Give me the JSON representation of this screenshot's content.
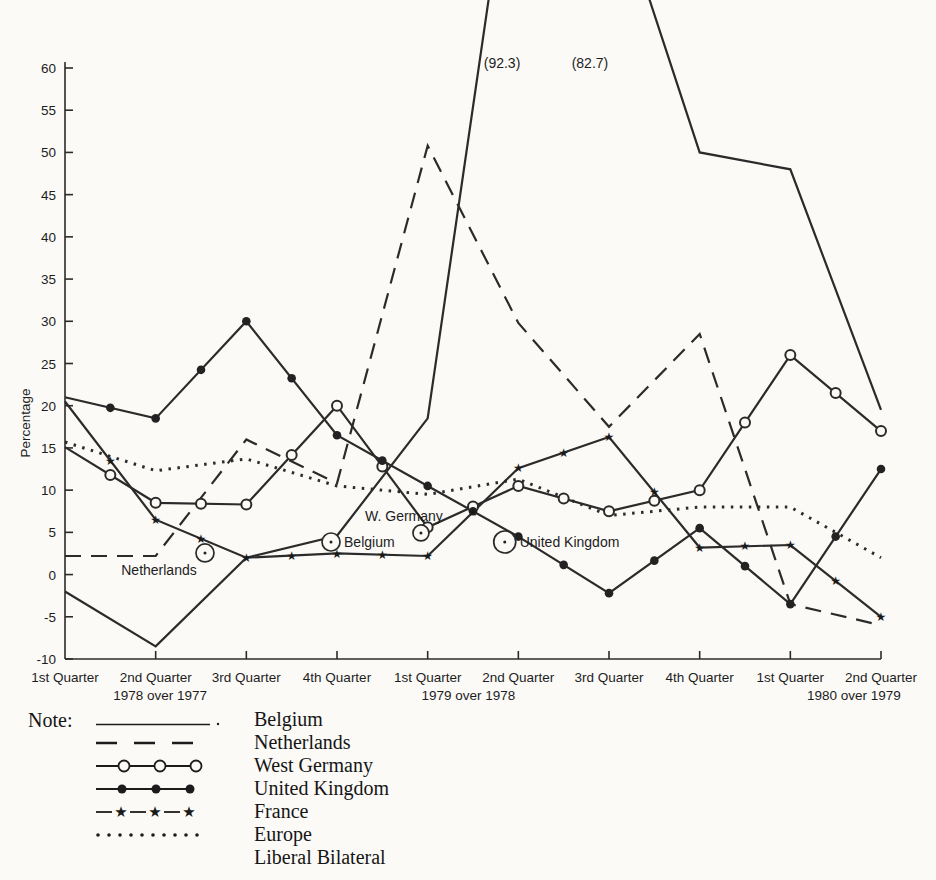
{
  "figure": {
    "background": "#fbfaf7",
    "ink": "#2b2b2b"
  },
  "chart_data": {
    "type": "line",
    "title": "",
    "ylabel": "Percentage",
    "grid": false,
    "x_categories": [
      "1st Quarter",
      "2nd Quarter",
      "3rd Quarter",
      "4th Quarter",
      "1st Quarter",
      "2nd Quarter",
      "3rd Quarter",
      "4th Quarter",
      "1st Quarter",
      "2nd Quarter"
    ],
    "year_labels": [
      {
        "text": "1978 over 1977",
        "q": 1.05
      },
      {
        "text": "1979 over 1978",
        "q": 4.45
      },
      {
        "text": "1980 over 1979",
        "q": 8.7
      }
    ],
    "y_ticks": [
      {
        "v": 60,
        "label": "60"
      },
      {
        "v": 55,
        "label": "55"
      },
      {
        "v": 50,
        "label": "50"
      },
      {
        "v": 45,
        "label": "45"
      },
      {
        "v": 40,
        "label": "40"
      },
      {
        "v": 35,
        "label": "35"
      },
      {
        "v": 30,
        "label": "30"
      },
      {
        "v": 25,
        "label": "25"
      },
      {
        "v": 20,
        "label": "20"
      },
      {
        "v": 15,
        "label": "15"
      },
      {
        "v": 10,
        "label": "10"
      },
      {
        "v": 5,
        "label": "5"
      },
      {
        "v": 0,
        "label": "0"
      },
      {
        "v": -5,
        "label": "-5"
      },
      {
        "v": -10,
        "label": "-10"
      }
    ],
    "ylim": [
      -10,
      60
    ],
    "plot": {
      "x_left": 65,
      "x_right": 881,
      "y_top": 68,
      "y_bottom": 659,
      "vmax": 60,
      "vmin": -10
    },
    "series": [
      {
        "name": "Belgium",
        "line": "solid",
        "marker": "none",
        "values": [
          -2,
          -8.5,
          2,
          4.6,
          18.5,
          92.3,
          82.7,
          50,
          48,
          19.5
        ]
      },
      {
        "name": "Netherlands",
        "line": "dashed",
        "marker": "none",
        "values": [
          2.2,
          2.2,
          16,
          10.8,
          50.8,
          29.8,
          17.5,
          28.5,
          -3.5,
          -6
        ]
      },
      {
        "name": "West Germany",
        "line": "solid",
        "marker": "circle",
        "values": [
          15.1,
          8.5,
          8.3,
          20,
          5.6,
          10.5,
          7.5,
          10,
          26,
          17
        ]
      },
      {
        "name": "United Kingdom",
        "line": "solid",
        "marker": "dot",
        "values": [
          21,
          18.5,
          30,
          16.5,
          10.5,
          4.5,
          -2.2,
          5.5,
          -3.5,
          12.5
        ]
      },
      {
        "name": "France",
        "line": "solid",
        "marker": "star",
        "values": [
          20.5,
          6.5,
          2,
          2.5,
          2.2,
          12.6,
          16.3,
          3.2,
          3.5,
          -5
        ]
      },
      {
        "name": "Europe Liberal Bilateral",
        "line": "dotted",
        "marker": "none",
        "values": [
          15.7,
          12.3,
          13.7,
          10.5,
          9.5,
          11.3,
          7,
          8,
          8,
          2
        ]
      }
    ],
    "annotations": [
      {
        "text": "(92.3)",
        "q": 4.82,
        "v": 60.5
      },
      {
        "text": "(82.7)",
        "q": 5.79,
        "v": 60.5
      }
    ],
    "callouts": [
      {
        "label": "Netherlands",
        "q": 1.544,
        "v": 2.56,
        "r": 9,
        "anchor": "middle",
        "dx": -46,
        "dy": 22
      },
      {
        "label": "Belgium",
        "q": 2.934,
        "v": 3.86,
        "r": 9,
        "anchor": "start",
        "dx": 13,
        "dy": 5
      },
      {
        "label": "W. Germany",
        "q": 3.926,
        "v": 4.93,
        "r": 8,
        "anchor": "middle",
        "dx": -17,
        "dy": -12
      },
      {
        "label": "United Kingdom",
        "q": 4.85,
        "v": 3.86,
        "r": 11,
        "anchor": "start",
        "dx": 15,
        "dy": 5
      }
    ]
  },
  "legend": {
    "note_label": "Note:",
    "items": [
      {
        "label": "Belgium",
        "style": "solid"
      },
      {
        "label": "Netherlands",
        "style": "dashed"
      },
      {
        "label": "West Germany",
        "style": "circle"
      },
      {
        "label": "United Kingdom",
        "style": "dot"
      },
      {
        "label": "France",
        "style": "star"
      },
      {
        "label": "Europe",
        "label2": "Liberal Bilateral",
        "style": "dotted"
      }
    ]
  }
}
